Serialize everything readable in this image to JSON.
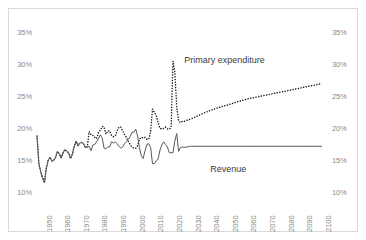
{
  "chart_data": {
    "type": "line",
    "title": "",
    "subtitle": "",
    "xlabel": "",
    "ylabel": "",
    "xlim": [
      1947,
      2100
    ],
    "ylim": [
      10,
      35
    ],
    "y_unit": "%",
    "grid": false,
    "legend": "annotations-on-plot",
    "dual_axis": true,
    "y_ticks": [
      10,
      15,
      20,
      25,
      30,
      35
    ],
    "y_tick_labels_left": [
      "10%",
      "15%",
      "20%",
      "25%",
      "30%",
      "35%"
    ],
    "y_tick_labels_right": [
      "10%",
      "15%",
      "20%",
      "25%",
      "30%",
      "35%"
    ],
    "x_ticks": [
      1950,
      1960,
      1970,
      1980,
      1990,
      2000,
      2010,
      2020,
      2030,
      2040,
      2050,
      2060,
      2070,
      2080,
      2090,
      2100
    ],
    "x_tick_labels": [
      "1950",
      "1960",
      "1970",
      "1980",
      "1990",
      "2000",
      "2010",
      "2020",
      "2030",
      "2040",
      "2050",
      "2060",
      "2070",
      "2080",
      "2090",
      "2100"
    ],
    "annotations": [
      {
        "text": "Primary expenditure",
        "x": 2026,
        "y": 30.6
      },
      {
        "text": "Revenue",
        "x": 2040,
        "y": 13.6
      }
    ],
    "series": [
      {
        "name": "Primary expenditure",
        "style": "dotted",
        "color": "#1a1a1a",
        "x": [
          1947,
          1948,
          1949,
          1950,
          1951,
          1952,
          1953,
          1954,
          1955,
          1956,
          1957,
          1958,
          1959,
          1960,
          1961,
          1962,
          1963,
          1964,
          1965,
          1966,
          1967,
          1968,
          1969,
          1970,
          1971,
          1972,
          1973,
          1974,
          1975,
          1976,
          1977,
          1978,
          1979,
          1980,
          1981,
          1982,
          1983,
          1984,
          1985,
          1986,
          1987,
          1988,
          1989,
          1990,
          1991,
          1992,
          1993,
          1994,
          1995,
          1996,
          1997,
          1998,
          1999,
          2000,
          2001,
          2002,
          2003,
          2004,
          2005,
          2006,
          2007,
          2008,
          2009,
          2010,
          2011,
          2012,
          2013,
          2014,
          2015,
          2016,
          2017,
          2018,
          2019,
          2020,
          2021,
          2022,
          2023,
          2024,
          2025,
          2026,
          2027,
          2028,
          2029,
          2030,
          2035,
          2040,
          2045,
          2050,
          2055,
          2060,
          2065,
          2070,
          2075,
          2080,
          2085,
          2090,
          2095,
          2100
        ],
        "y": [
          18.9,
          14.6,
          13.3,
          12.4,
          11.6,
          13.9,
          15.1,
          15.6,
          15.0,
          15.1,
          15.6,
          16.5,
          16.1,
          15.5,
          16.3,
          16.8,
          16.5,
          16.3,
          15.4,
          16.1,
          17.3,
          18.1,
          17.4,
          17.8,
          17.9,
          17.7,
          17.1,
          17.2,
          19.6,
          19.1,
          19.0,
          18.7,
          18.5,
          19.5,
          19.8,
          20.4,
          20.3,
          19.2,
          19.7,
          19.7,
          19.0,
          18.8,
          18.9,
          19.7,
          20.3,
          20.3,
          19.7,
          19.1,
          18.7,
          18.1,
          17.6,
          17.2,
          17.0,
          17.0,
          17.4,
          18.4,
          18.7,
          18.6,
          18.7,
          18.4,
          18.4,
          19.6,
          23.1,
          22.6,
          22.1,
          21.0,
          20.1,
          20.0,
          20.1,
          20.3,
          20.0,
          20.0,
          20.2,
          30.6,
          28.9,
          23.5,
          21.3,
          21.0,
          21.2,
          21.2,
          21.3,
          21.4,
          21.5,
          21.6,
          22.3,
          22.9,
          23.4,
          23.8,
          24.3,
          24.7,
          25.0,
          25.3,
          25.6,
          25.9,
          26.2,
          26.5,
          26.8,
          27.1
        ]
      },
      {
        "name": "Revenue",
        "style": "solid",
        "color": "#595959",
        "x": [
          1947,
          1948,
          1949,
          1950,
          1951,
          1952,
          1953,
          1954,
          1955,
          1956,
          1957,
          1958,
          1959,
          1960,
          1961,
          1962,
          1963,
          1964,
          1965,
          1966,
          1967,
          1968,
          1969,
          1970,
          1971,
          1972,
          1973,
          1974,
          1975,
          1976,
          1977,
          1978,
          1979,
          1980,
          1981,
          1982,
          1983,
          1984,
          1985,
          1986,
          1987,
          1988,
          1989,
          1990,
          1991,
          1992,
          1993,
          1994,
          1995,
          1996,
          1997,
          1998,
          1999,
          2000,
          2001,
          2002,
          2003,
          2004,
          2005,
          2006,
          2007,
          2008,
          2009,
          2010,
          2011,
          2012,
          2013,
          2014,
          2015,
          2016,
          2017,
          2018,
          2019,
          2020,
          2021,
          2022,
          2023,
          2024,
          2025,
          2026,
          2027,
          2028,
          2029,
          2030,
          2035,
          2040,
          2045,
          2050,
          2055,
          2060,
          2065,
          2070,
          2075,
          2080,
          2085,
          2090,
          2095,
          2100
        ],
        "y": [
          18.9,
          14.6,
          13.3,
          12.4,
          11.6,
          13.9,
          15.1,
          15.6,
          15.0,
          15.1,
          15.6,
          16.5,
          16.1,
          15.5,
          16.3,
          16.8,
          16.5,
          16.3,
          15.4,
          16.1,
          17.3,
          18.1,
          17.4,
          17.8,
          17.9,
          17.7,
          17.1,
          17.2,
          17.3,
          16.6,
          17.5,
          17.6,
          18.0,
          18.5,
          19.1,
          18.6,
          17.0,
          16.9,
          17.2,
          17.2,
          18.0,
          17.8,
          18.0,
          17.7,
          17.3,
          17.0,
          17.2,
          17.7,
          18.0,
          18.4,
          18.8,
          19.5,
          19.5,
          20.0,
          18.9,
          17.1,
          15.8,
          15.4,
          16.6,
          17.6,
          17.7,
          17.1,
          14.6,
          14.6,
          15.0,
          15.3,
          16.7,
          17.5,
          18.0,
          17.6,
          17.2,
          16.3,
          16.3,
          16.3,
          18.1,
          19.3,
          16.5,
          17.1,
          17.2,
          17.1,
          17.2,
          17.2,
          17.3,
          17.3,
          17.3,
          17.3,
          17.3,
          17.3,
          17.3,
          17.3,
          17.3,
          17.3,
          17.3,
          17.3,
          17.3,
          17.3,
          17.3,
          17.3
        ]
      }
    ]
  },
  "axes": {
    "left_ticks": [
      "35%",
      "30%",
      "25%",
      "20%",
      "15%",
      "10%"
    ],
    "right_ticks": [
      "35%",
      "30%",
      "25%",
      "20%",
      "15%",
      "10%"
    ]
  }
}
